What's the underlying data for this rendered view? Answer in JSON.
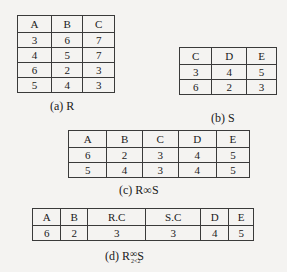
{
  "tables": {
    "R": {
      "headers": [
        "A",
        "B",
        "C"
      ],
      "rows": [
        [
          "3",
          "6",
          "7"
        ],
        [
          "4",
          "5",
          "7"
        ],
        [
          "6",
          "2",
          "3"
        ],
        [
          "5",
          "4",
          "3"
        ]
      ],
      "caption": "(a) R"
    },
    "S": {
      "headers": [
        "C",
        "D",
        "E"
      ],
      "rows": [
        [
          "3",
          "4",
          "5"
        ],
        [
          "6",
          "2",
          "3"
        ]
      ],
      "caption": "(b) S"
    },
    "natural_join": {
      "headers": [
        "A",
        "B",
        "C",
        "D",
        "E"
      ],
      "rows": [
        [
          "6",
          "2",
          "3",
          "4",
          "5"
        ],
        [
          "5",
          "4",
          "3",
          "4",
          "5"
        ]
      ],
      "caption_prefix": "(c) R",
      "caption_op": "∞",
      "caption_suffix": "S"
    },
    "theta_join": {
      "headers": [
        "A",
        "B",
        "R.C",
        "S.C",
        "D",
        "E"
      ],
      "rows": [
        [
          "6",
          "2",
          "3",
          "3",
          "4",
          "5"
        ]
      ],
      "caption_prefix": "(d) R",
      "caption_op": "∞",
      "caption_condition": "2<2",
      "caption_suffix": "S"
    }
  }
}
